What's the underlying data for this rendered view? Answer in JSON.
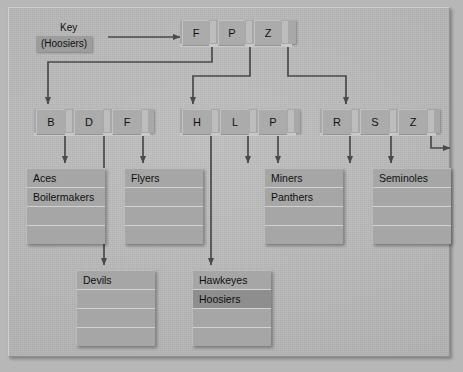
{
  "diagram": {
    "key_label": "Key",
    "key_value": "(Hoosiers)",
    "colors": {
      "canvas": "#b9b9b9",
      "node_fill": "#ababab",
      "leaf_fill": "#a6a6a6",
      "highlight": "#8e8e8e",
      "arrow": "#4a4a4a",
      "separator": "#d2d2d2"
    }
  },
  "root_node": {
    "name": "root-index-node",
    "keys": [
      "F",
      "P",
      "Z"
    ]
  },
  "level2_nodes": [
    {
      "name": "index-node-bdf",
      "keys": [
        "B",
        "D",
        "F"
      ]
    },
    {
      "name": "index-node-hlp",
      "keys": [
        "H",
        "L",
        "P"
      ]
    },
    {
      "name": "index-node-rsz",
      "keys": [
        "R",
        "S",
        "Z"
      ]
    }
  ],
  "leaves": [
    {
      "name": "leaf-aces",
      "rows": [
        "Aces",
        "Boilermakers",
        "",
        ""
      ],
      "highlight_row": -1
    },
    {
      "name": "leaf-devils",
      "rows": [
        "Devils",
        "",
        "",
        ""
      ],
      "highlight_row": -1
    },
    {
      "name": "leaf-flyers",
      "rows": [
        "Flyers",
        "",
        "",
        ""
      ],
      "highlight_row": -1
    },
    {
      "name": "leaf-hawkeyes",
      "rows": [
        "Hawkeyes",
        "Hoosiers",
        "",
        ""
      ],
      "highlight_row": 1
    },
    {
      "name": "leaf-miners",
      "rows": [
        "Miners",
        "Panthers",
        "",
        ""
      ],
      "highlight_row": -1
    },
    {
      "name": "leaf-seminoles",
      "rows": [
        "Seminoles",
        "",
        "",
        ""
      ],
      "highlight_row": -1
    }
  ]
}
